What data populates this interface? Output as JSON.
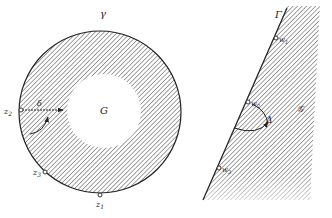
{
  "left_figure": {
    "boundary_label": "γ",
    "region_label": "G",
    "angle_label": "δ",
    "points": [
      {
        "name": "z1",
        "base": "z",
        "sub": "1"
      },
      {
        "name": "z2",
        "base": "z",
        "sub": "2"
      },
      {
        "name": "z3",
        "base": "z",
        "sub": "3"
      }
    ]
  },
  "right_figure": {
    "boundary_label": "Γ",
    "region_label": "𝒢",
    "angle_label": "Δ",
    "points": [
      {
        "name": "w1",
        "base": "w",
        "sub": "1"
      },
      {
        "name": "w2",
        "base": "w",
        "sub": "2"
      },
      {
        "name": "w3",
        "base": "w",
        "sub": "3"
      }
    ]
  },
  "colors": {
    "ink": "#222222",
    "hatch": "#444444",
    "background": "#ffffff"
  }
}
